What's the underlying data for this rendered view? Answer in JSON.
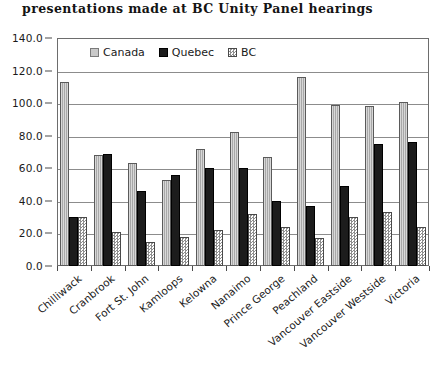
{
  "chart_data": {
    "type": "bar",
    "title": "presentations made at BC Unity Panel hearings",
    "xlabel": "",
    "ylabel": "",
    "ylim": [
      0.0,
      140.0
    ],
    "ytick_step": 20.0,
    "ytick_labels": [
      "140.0",
      "120.0",
      "100.0",
      "80.0",
      "60.0",
      "40.0",
      "20.0",
      "0.0"
    ],
    "grid": true,
    "legend_position": "top-center-inside",
    "categories": [
      "Chilliwack",
      "Cranbrook",
      "Fort St. John",
      "Kamloops",
      "Kelowna",
      "Nanaimo",
      "Prince George",
      "Peachland",
      "Vancouver Eastside",
      "Vancouver Westside",
      "Victoria"
    ],
    "series": [
      {
        "name": "Canada",
        "color": "#a8a8a8",
        "pattern": "light-gray-solid",
        "values": [
          113,
          68,
          63,
          53,
          72,
          82,
          67,
          116,
          99,
          98,
          101
        ]
      },
      {
        "name": "Quebec",
        "color": "#1c1c1c",
        "pattern": "solid-black",
        "values": [
          30,
          69,
          46,
          56,
          60,
          60,
          40,
          37,
          49,
          75,
          76
        ]
      },
      {
        "name": "BC",
        "color": "#8f8f8f",
        "pattern": "checkered",
        "values": [
          30,
          21,
          15,
          18,
          22,
          32,
          24,
          17,
          30,
          33,
          24
        ]
      }
    ]
  },
  "legend": {
    "items": [
      {
        "label": "Canada",
        "swatch": "canada"
      },
      {
        "label": "Quebec",
        "swatch": "quebec"
      },
      {
        "label": "BC",
        "swatch": "bc"
      }
    ]
  }
}
